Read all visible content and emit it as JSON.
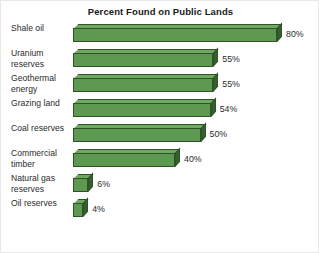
{
  "chart_data": {
    "type": "bar",
    "orientation": "horizontal",
    "style": "3d-bar",
    "title": "Percent Found on Public Lands",
    "xlabel": "",
    "ylabel": "",
    "xlim": [
      0,
      80
    ],
    "grid": false,
    "legend": null,
    "value_suffix": "%",
    "categories": [
      "Shale oil",
      "Uranium reserves",
      "Geothermal energy",
      "Grazing land",
      "Coal reserves",
      "Commercial timber",
      "Natural gas reserves",
      "Oil reserves"
    ],
    "values": [
      80,
      55,
      55,
      54,
      50,
      40,
      6,
      4
    ],
    "value_labels": [
      "80%",
      "55%",
      "55%",
      "54%",
      "50%",
      "40%",
      "6%",
      "4%"
    ],
    "colors": {
      "bar_front": "#5d9950",
      "bar_top": "#6fa85f",
      "bar_side": "#33602c",
      "bar_outline": "#2f5228",
      "background": "#ffffff",
      "text": "#2b2b2b",
      "title": "#1a1a1a"
    }
  }
}
